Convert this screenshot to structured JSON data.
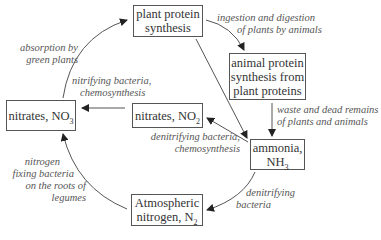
{
  "diagram": {
    "nodes": {
      "plant_protein": {
        "line1": "plant protein",
        "line2": "synthesis"
      },
      "animal_protein": {
        "line1": "animal protein",
        "line2": "synthesis from",
        "line3": "plant proteins"
      },
      "nitrates_no3": {
        "text": "nitrates, NO",
        "sub": "3"
      },
      "nitrates_no2": {
        "text": "nitrates, NO",
        "sub": "2"
      },
      "ammonia": {
        "line1": "ammonia,",
        "line2": "NH",
        "sub": "3"
      },
      "atmospheric_nitrogen": {
        "line1": "Atmospheric",
        "line2": "nitrogen, N",
        "sub": "2"
      }
    },
    "edges": {
      "ingestion": {
        "line1": "ingestion and digestion",
        "line2": "of plants by animals"
      },
      "absorption": {
        "line1": "absorption by",
        "line2": "green plants"
      },
      "nitrifying": {
        "line1": "nitrifying bacteria,",
        "line2": "chemosynthesis"
      },
      "waste": {
        "line1": "waste and dead remains",
        "line2": "of plants and animals"
      },
      "denitrifying_chemo": {
        "line1": "denitrifying bacteria,",
        "line2": "chemosynthesis"
      },
      "nitrogen_fixing": {
        "line1": "nitrogen",
        "line2": "fixing bacteria",
        "line3": "on the roots of",
        "line4": "legumes"
      },
      "denitrifying": {
        "line1": "denitrifying",
        "line2": "bacteria"
      }
    },
    "colors": {
      "stroke": "#555555",
      "text": "#333333",
      "label": "#555555",
      "background": "#ffffff"
    }
  }
}
